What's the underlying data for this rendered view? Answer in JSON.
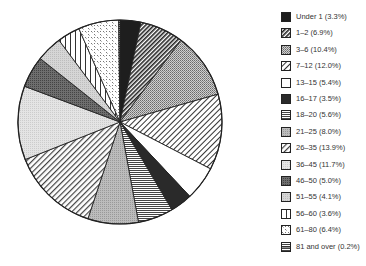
{
  "chart_data": {
    "type": "pie",
    "title": "",
    "categories": [
      "Under 1",
      "1–2",
      "3–6",
      "7–12",
      "13–15",
      "16–17",
      "18–20",
      "21–25",
      "26–35",
      "36–45",
      "46–50",
      "51–55",
      "56–60",
      "61–80",
      "81 and over"
    ],
    "values": [
      3.3,
      6.9,
      10.4,
      12.0,
      5.4,
      3.5,
      5.6,
      8.0,
      13.9,
      11.7,
      5.0,
      4.1,
      3.6,
      6.4,
      0.2
    ],
    "legend_position": "right",
    "start_angle": "12 o'clock",
    "direction": "clockwise",
    "legend": [
      {
        "label": "Under 1 (3.3%)",
        "pattern": "solid-dark"
      },
      {
        "label": "1–2 (6.9%)",
        "pattern": "diagonal-dense"
      },
      {
        "label": "3–6 (10.4%)",
        "pattern": "gray-dots"
      },
      {
        "label": "7–12 (12.0%)",
        "pattern": "diagonal-light"
      },
      {
        "label": "13–15 (5.4%)",
        "pattern": "white"
      },
      {
        "label": "16–17 (3.5%)",
        "pattern": "dark-gray"
      },
      {
        "label": "18–20 (5.6%)",
        "pattern": "horizontal-lines"
      },
      {
        "label": "21–25 (8.0%)",
        "pattern": "mid-gray"
      },
      {
        "label": "26–35 (13.9%)",
        "pattern": "diagonal-half"
      },
      {
        "label": "36–45 (11.7%)",
        "pattern": "light-gray"
      },
      {
        "label": "46–50 (5.0%)",
        "pattern": "darker-gray"
      },
      {
        "label": "51–55 (4.1%)",
        "pattern": "pale-gray"
      },
      {
        "label": "56–60 (3.6%)",
        "pattern": "vertical-lines"
      },
      {
        "label": "61–80 (6.4%)",
        "pattern": "dashes"
      },
      {
        "label": "81 and over (0.2%)",
        "pattern": "horizontal-box"
      }
    ]
  }
}
